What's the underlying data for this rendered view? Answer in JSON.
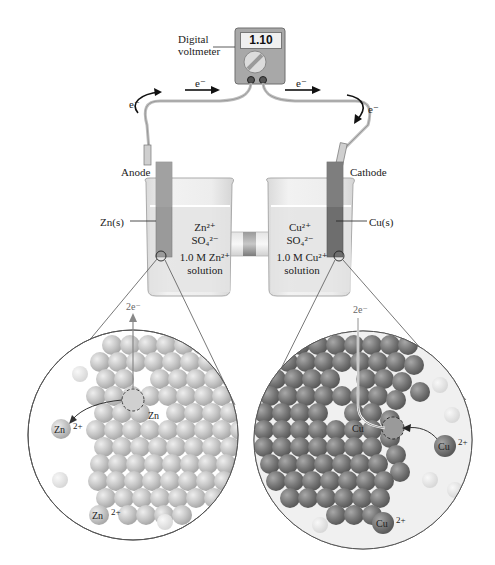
{
  "voltmeter": {
    "label_line1": "Digital",
    "label_line2": "voltmeter",
    "reading": "1.10"
  },
  "electron_flow": {
    "left_curve_label": "e⁻",
    "left_arrow_label": "e⁻",
    "right_arrow_label": "e⁻",
    "right_curve_label": "e⁻"
  },
  "anode": {
    "label": "Anode",
    "electrode_label": "Zn(s)",
    "ion1": "Zn²⁺",
    "ion2": "SO₄²⁻",
    "concentration": "1.0 M Zn²⁺",
    "solution": "solution"
  },
  "cathode": {
    "label": "Cathode",
    "electrode_label": "Cu(s)",
    "ion1": "Cu²⁺",
    "ion2": "SO₄²⁻",
    "concentration": "1.0 M Cu²⁺",
    "solution": "solution"
  },
  "zinc_zoom": {
    "electrons": "2e⁻",
    "atom_label": "Zn",
    "ion_label_1": "Zn",
    "ion_charge_1": "2+",
    "ion_label_2": "Zn",
    "ion_charge_2": "2+"
  },
  "copper_zoom": {
    "electrons": "2e⁻",
    "atom_label": "Cu",
    "ion_label_1": "Cu",
    "ion_charge_1": "2+",
    "ion_label_2": "Cu",
    "ion_charge_2": "2+"
  },
  "colors": {
    "zinc_electrode": "#9a9a9a",
    "copper_electrode": "#6e6e6e",
    "solution": "#e6e6e6",
    "zinc_atom": "#c4c4c4",
    "copper_atom": "#7a7a7a"
  }
}
